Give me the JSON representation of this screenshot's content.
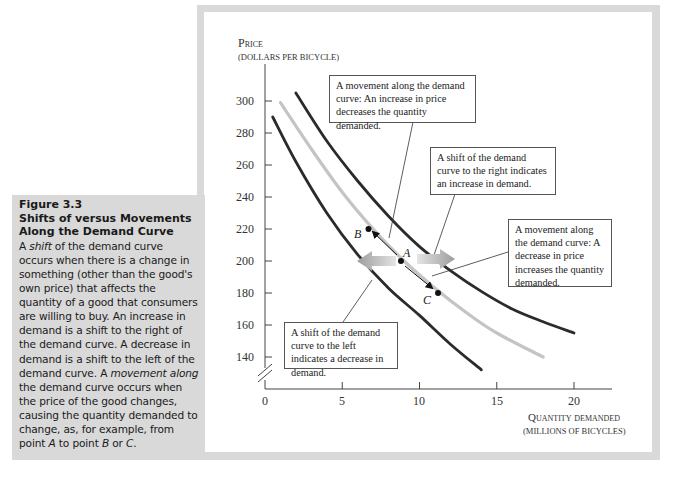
{
  "caption": {
    "figure_number": "Figure 3.3",
    "title": "Shifts of versus Movements Along the Demand Curve",
    "body_parts": [
      {
        "text": "A ",
        "italic": false
      },
      {
        "text": "shift",
        "italic": true
      },
      {
        "text": " of the demand curve occurs when there is a change in something (other than the good's own price) that affects the quantity of a good that consumers are willing to buy. An increase in demand is a shift to the right of the demand curve. A decrease in demand is a shift to the left of the demand curve. A ",
        "italic": false
      },
      {
        "text": "movement along",
        "italic": true
      },
      {
        "text": " the demand curve occurs when the price of the good changes, causing the quantity demanded to change, as, for example, from point ",
        "italic": false
      },
      {
        "text": "A",
        "italic": true
      },
      {
        "text": " to point ",
        "italic": false
      },
      {
        "text": "B",
        "italic": true
      },
      {
        "text": " or ",
        "italic": false
      },
      {
        "text": "C",
        "italic": true
      },
      {
        "text": ".",
        "italic": false
      }
    ]
  },
  "annotations": {
    "movement_up": "A movement along the demand curve: An increase in price decreases the quantity demanded.",
    "shift_right": "A shift of the demand curve to the right indicates an increase in demand.",
    "movement_down": "A movement along the demand curve: A decrease in price increases the quantity demanded.",
    "shift_left": "A shift of the demand curve to the left indicates a decrease in demand."
  },
  "colors": {
    "frame": "#d9d9d9",
    "caption_bg": "#d9d9d9",
    "shifted_curves": "#2b2b2b",
    "original_curve": "#c4c4c4",
    "shift_arrow": "#a8a8a8"
  },
  "chart_data": {
    "type": "line",
    "title": "",
    "ylabel": "Price",
    "ylabel_sub": "(dollars per bicycle)",
    "xlabel": "Quantity demanded",
    "xlabel_sub": "(millions of bicycles)",
    "xlim": [
      0,
      22
    ],
    "ylim": [
      120,
      310
    ],
    "y_axis_break": true,
    "grid": false,
    "x_ticks": [
      0,
      5,
      10,
      15,
      20
    ],
    "y_ticks": [
      140,
      160,
      180,
      200,
      220,
      240,
      260,
      280,
      300
    ],
    "series": [
      {
        "name": "Demand curve after decrease (shift left)",
        "color": "#2b2b2b",
        "x": [
          0.5,
          2,
          4,
          6,
          8,
          10,
          12,
          14
        ],
        "y": [
          290,
          262,
          230,
          204,
          183,
          166,
          148,
          132
        ]
      },
      {
        "name": "Original demand curve",
        "color": "#c4c4c4",
        "x": [
          1,
          3,
          5,
          7,
          9,
          11,
          13,
          15,
          18
        ],
        "y": [
          299,
          270,
          243,
          220,
          200,
          183,
          168,
          155,
          140
        ]
      },
      {
        "name": "Demand curve after increase (shift right)",
        "color": "#2b2b2b",
        "x": [
          2,
          4,
          6,
          8,
          10,
          12,
          14,
          16,
          18,
          20
        ],
        "y": [
          305,
          275,
          250,
          228,
          209,
          194,
          181,
          170,
          162,
          155
        ]
      }
    ],
    "points": [
      {
        "label": "A",
        "x": 8.8,
        "y": 200
      },
      {
        "label": "B",
        "x": 6.7,
        "y": 220
      },
      {
        "label": "C",
        "x": 11.2,
        "y": 180
      }
    ],
    "annotations": [
      "A movement along the demand curve: An increase in price decreases the quantity demanded.",
      "A shift of the demand curve to the right indicates an increase in demand.",
      "A movement along the demand curve: A decrease in price increases the quantity demanded.",
      "A shift of the demand curve to the left indicates a decrease in demand."
    ]
  },
  "axis_labels": {
    "y_title": "Price",
    "y_sub": "(dollars per bicycle)",
    "x_title": "Quantity demanded",
    "x_sub": "(millions of bicycles)"
  },
  "tick_labels": {
    "y": [
      "300",
      "280",
      "260",
      "240",
      "220",
      "200",
      "180",
      "160",
      "140"
    ],
    "x": [
      "0",
      "5",
      "10",
      "15",
      "20"
    ]
  },
  "point_labels": {
    "a": "A",
    "b": "B",
    "c": "C"
  }
}
